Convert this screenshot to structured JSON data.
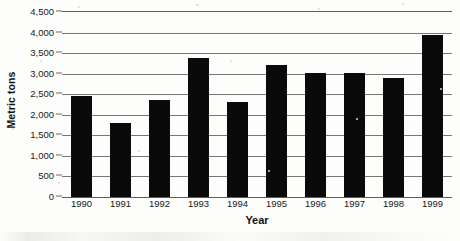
{
  "chart_data": {
    "type": "bar",
    "title": "",
    "xlabel": "Year",
    "ylabel": "Metric tons",
    "categories": [
      "1990",
      "1991",
      "1992",
      "1993",
      "1994",
      "1995",
      "1996",
      "1997",
      "1998",
      "1999"
    ],
    "values": [
      2450,
      1800,
      2370,
      3380,
      2300,
      3200,
      3020,
      3020,
      2900,
      3950
    ],
    "ylim": [
      0,
      4500
    ],
    "ytick_values": [
      0,
      500,
      1000,
      1500,
      2000,
      2500,
      3000,
      3500,
      4000,
      4500
    ],
    "ytick_labels": [
      "0",
      "500",
      "1,000",
      "1,500",
      "2,000",
      "2,500",
      "3,000",
      "3,500",
      "4,000",
      "4,500"
    ],
    "grid": "horizontal",
    "legend": "none",
    "series": [
      {
        "name": "Metric tons",
        "values": [
          2450,
          1800,
          2370,
          3380,
          2300,
          3200,
          3020,
          3020,
          2900,
          3950
        ]
      }
    ],
    "colors": {
      "bar": "#0a0a0a",
      "gridline": "#777777",
      "axis": "#5c5c5c",
      "text": "#1a1a1a",
      "background": "#fdfdfb"
    }
  }
}
